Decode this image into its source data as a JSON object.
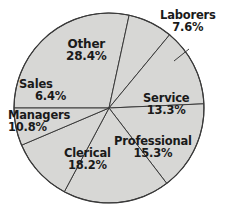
{
  "chart_data": {
    "type": "pie",
    "title": "",
    "subtitle": "",
    "xlabel": "",
    "ylabel": "",
    "legend_position": "none",
    "grid": false,
    "labels_inside": true,
    "units": "percent",
    "total": 100.0,
    "categories": [
      "Other",
      "Laborers",
      "Service",
      "Professional",
      "Clerical",
      "Managers",
      "Sales"
    ],
    "values": [
      28.4,
      7.6,
      13.3,
      15.3,
      18.2,
      10.8,
      6.4
    ],
    "slices": [
      {
        "label": "Other",
        "value": 28.4,
        "value_text": "28.4%",
        "start_angle_deg": 180,
        "end_angle_deg": 282.24,
        "color": "#d7d7d5",
        "label_placement": "inside",
        "leader_line": false
      },
      {
        "label": "Laborers",
        "value": 7.6,
        "value_text": "7.6%",
        "start_angle_deg": 282.24,
        "end_angle_deg": 309.6,
        "color": "#d7d7d5",
        "label_placement": "outside",
        "leader_line": true
      },
      {
        "label": "Service",
        "value": 13.3,
        "value_text": "13.3%",
        "start_angle_deg": 309.6,
        "end_angle_deg": 357.48,
        "color": "#d7d7d5",
        "label_placement": "inside",
        "leader_line": false
      },
      {
        "label": "Professional",
        "value": 15.3,
        "value_text": "15.3%",
        "start_angle_deg": 357.48,
        "end_angle_deg": 412.56,
        "color": "#d7d7d5",
        "label_placement": "inside",
        "leader_line": false
      },
      {
        "label": "Clerical",
        "value": 18.2,
        "value_text": "18.2%",
        "start_angle_deg": 412.56,
        "end_angle_deg": 478.08,
        "color": "#d7d7d5",
        "label_placement": "inside",
        "leader_line": false
      },
      {
        "label": "Managers",
        "value": 10.8,
        "value_text": "10.8%",
        "start_angle_deg": 478.08,
        "end_angle_deg": 516.96,
        "color": "#d7d7d5",
        "label_placement": "inside",
        "leader_line": false
      },
      {
        "label": "Sales",
        "value": 6.4,
        "value_text": "6.4%",
        "start_angle_deg": 516.96,
        "end_angle_deg": 540,
        "color": "#d7d7d5",
        "label_placement": "inside",
        "leader_line": false
      }
    ]
  },
  "style": {
    "background": "#ffffff",
    "slice_fill": "#d7d7d5",
    "slice_stroke": "#3a3a3a",
    "text_color": "#1a1a1a",
    "leader_line_color": "#3a3a3a"
  },
  "geometry": {
    "center_x": 109,
    "center_y": 108,
    "radius": 95
  }
}
